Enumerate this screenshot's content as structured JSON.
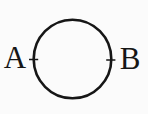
{
  "figure": {
    "type": "geometry-diagram",
    "shape": "circle",
    "background_color": "#fbfbfb",
    "line_color": "#161616",
    "points": {
      "left": {
        "label": "A",
        "marker": "plus-marker"
      },
      "right": {
        "label": "B",
        "marker": "plus-marker"
      }
    }
  }
}
